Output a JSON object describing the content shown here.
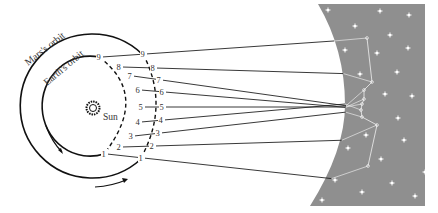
{
  "diagram": {
    "labels": {
      "mars_orbit": "Mars's orbit",
      "earth_orbit": "Earth's orbit",
      "sun": "Sun"
    },
    "earth_positions": [
      {
        "n": "1",
        "x": 104,
        "y": 154
      },
      {
        "n": "2",
        "x": 119,
        "y": 147
      },
      {
        "n": "3",
        "x": 131,
        "y": 136
      },
      {
        "n": "4",
        "x": 138,
        "y": 122
      },
      {
        "n": "5",
        "x": 141,
        "y": 107
      },
      {
        "n": "6",
        "x": 138,
        "y": 90
      },
      {
        "n": "7",
        "x": 130,
        "y": 76
      },
      {
        "n": "8",
        "x": 119,
        "y": 67
      },
      {
        "n": "9",
        "x": 99,
        "y": 57
      }
    ],
    "mars_positions": [
      {
        "n": "1",
        "x": 141,
        "y": 158
      },
      {
        "n": "2",
        "x": 152,
        "y": 146
      },
      {
        "n": "3",
        "x": 158,
        "y": 133
      },
      {
        "n": "4",
        "x": 161,
        "y": 120
      },
      {
        "n": "5",
        "x": 162,
        "y": 107
      },
      {
        "n": "6",
        "x": 162,
        "y": 92
      },
      {
        "n": "7",
        "x": 159,
        "y": 80
      },
      {
        "n": "8",
        "x": 153,
        "y": 68
      },
      {
        "n": "9",
        "x": 143,
        "y": 54
      }
    ],
    "sky_positions": [
      {
        "n": "1",
        "x": 368,
        "y": 166
      },
      {
        "n": "2",
        "x": 377,
        "y": 125
      },
      {
        "n": "3",
        "x": 362,
        "y": 117
      },
      {
        "n": "4",
        "x": 361,
        "y": 110
      },
      {
        "n": "5",
        "x": 362,
        "y": 104
      },
      {
        "n": "6",
        "x": 364,
        "y": 99
      },
      {
        "n": "7",
        "x": 364,
        "y": 90
      },
      {
        "n": "8",
        "x": 372,
        "y": 82
      },
      {
        "n": "9",
        "x": 367,
        "y": 38
      }
    ],
    "colors": {
      "sky": "#8f8f8f",
      "line": "#222222",
      "star": "#ffffff"
    }
  }
}
